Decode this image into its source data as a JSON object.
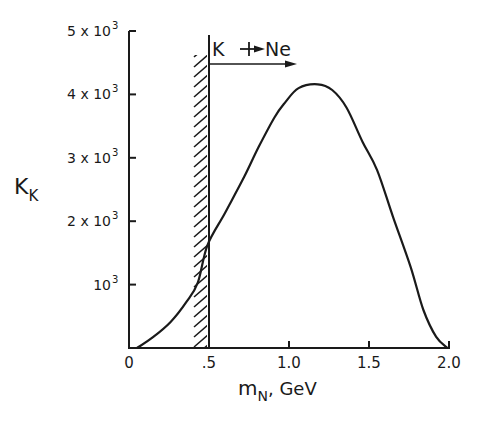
{
  "chart_data": {
    "type": "line",
    "title": "",
    "xlabel": "m",
    "xlabel_subscript": "N",
    "xlabel_unit": ", GeV",
    "ylabel": "K",
    "ylabel_subscript": "K",
    "xlim": [
      0,
      2.0
    ],
    "ylim": [
      0,
      5000
    ],
    "grid": false,
    "x_ticks": [
      {
        "value": 0,
        "label": "0"
      },
      {
        "value": 0.5,
        "label": ".5"
      },
      {
        "value": 1.0,
        "label": "1.0"
      },
      {
        "value": 1.5,
        "label": "1.5"
      },
      {
        "value": 2.0,
        "label": "2.0"
      }
    ],
    "y_ticks": [
      {
        "value": 1000,
        "label": "10",
        "exp": "3"
      },
      {
        "value": 2000,
        "label": "2 x 10",
        "exp": "3"
      },
      {
        "value": 3000,
        "label": "3 x 10",
        "exp": "3"
      },
      {
        "value": 4000,
        "label": "4 x 10",
        "exp": "3"
      },
      {
        "value": 5000,
        "label": "5 x 10",
        "exp": "3"
      }
    ],
    "series": [
      {
        "name": "K_K",
        "x": [
          0.05,
          0.15,
          0.26,
          0.36,
          0.43,
          0.49,
          0.6,
          0.72,
          0.81,
          0.91,
          0.975,
          1.06,
          1.18,
          1.27,
          1.36,
          1.46,
          1.55,
          1.65,
          1.76,
          1.84,
          1.92,
          1.99
        ],
        "y": [
          0,
          170,
          410,
          730,
          1030,
          1620,
          2130,
          2700,
          3170,
          3640,
          3870,
          4100,
          4160,
          4070,
          3790,
          3250,
          2810,
          2070,
          1280,
          600,
          175,
          0
        ]
      }
    ],
    "annotations": {
      "threshold_x": 0.5,
      "excluded_region": "hatched band left of m_N = 0.5 GeV",
      "arrow_label_left": "K",
      "arrow_label_right": "Ne",
      "arrow_from_x": 0.5,
      "arrow_to_x": 1.05
    }
  }
}
